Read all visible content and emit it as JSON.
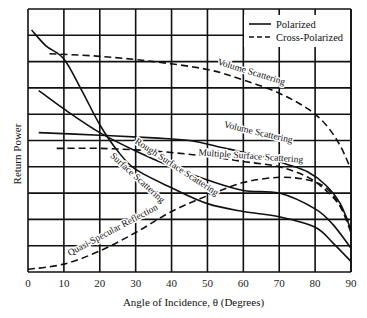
{
  "chart_data": {
    "type": "line",
    "title": "",
    "xlabel": "Angle of Incidence, θ (Degrees)",
    "ylabel": "Return Power",
    "xlim": [
      0,
      90
    ],
    "ylim": [
      0,
      10
    ],
    "x_ticks": [
      "0",
      "10",
      "20",
      "30",
      "40",
      "50",
      "60",
      "70",
      "80",
      "90"
    ],
    "y_ticks": [],
    "grid": true,
    "legend": {
      "position": "top-right",
      "entries": [
        {
          "label": "Polarized",
          "style": "solid"
        },
        {
          "label": "Cross-Polarized",
          "style": "dashed"
        }
      ]
    },
    "series": [
      {
        "name": "Volume Scattering (cross-polarized)",
        "style": "dashed",
        "x": [
          6,
          20,
          35,
          50,
          60,
          70,
          78,
          83,
          87,
          90
        ],
        "y": [
          8.3,
          8.2,
          8.0,
          7.7,
          7.3,
          6.8,
          6.2,
          5.6,
          4.8,
          3.9
        ]
      },
      {
        "name": "Surface Scattering (polarized)",
        "style": "solid",
        "x": [
          1,
          5,
          10,
          15,
          20,
          25,
          30,
          40,
          50,
          60,
          70,
          80,
          85,
          90
        ],
        "y": [
          9.2,
          8.6,
          8.1,
          6.9,
          5.6,
          4.6,
          3.9,
          3.2,
          2.6,
          2.3,
          2.1,
          1.7,
          1.1,
          0.4
        ]
      },
      {
        "name": "Rough Surface Scattering (polarized)",
        "style": "solid",
        "x": [
          3,
          10,
          20,
          30,
          40,
          50,
          60,
          70,
          80,
          85,
          90
        ],
        "y": [
          6.9,
          6.2,
          5.3,
          4.6,
          4.0,
          3.5,
          3.1,
          3.0,
          2.4,
          1.8,
          0.9
        ]
      },
      {
        "name": "Volume Scattering (polarized)",
        "style": "solid",
        "x": [
          3,
          20,
          35,
          45,
          55,
          65,
          72,
          78,
          83,
          87,
          90
        ],
        "y": [
          5.3,
          5.2,
          5.1,
          5.0,
          4.7,
          4.4,
          4.1,
          3.8,
          3.3,
          2.6,
          1.6
        ]
      },
      {
        "name": "Multiple Surface Scattering (cross-polarized)",
        "style": "dashed",
        "x": [
          8,
          20,
          35,
          50,
          60,
          70,
          78,
          83,
          87,
          90
        ],
        "y": [
          4.7,
          4.7,
          4.6,
          4.4,
          4.2,
          4.0,
          3.6,
          3.1,
          2.5,
          1.7
        ]
      },
      {
        "name": "Quasi-Specular Reflection (cross-polarized)",
        "style": "dashed",
        "x": [
          0,
          10,
          20,
          30,
          40,
          50,
          60,
          70,
          78,
          83,
          87,
          90
        ],
        "y": [
          0.1,
          0.3,
          0.8,
          1.5,
          2.3,
          2.9,
          3.4,
          3.6,
          3.5,
          3.2,
          2.5,
          1.5
        ]
      }
    ],
    "annotations": [
      {
        "text": "Volume Scattering",
        "x": 62,
        "y": 7.5,
        "rotation": 17
      },
      {
        "text": "Volume Scattering",
        "x": 64,
        "y": 5.2,
        "rotation": 13
      },
      {
        "text": "Multiple Surface Scattering",
        "x": 62,
        "y": 4.3,
        "rotation": 4
      },
      {
        "text": "Rough Surface Scattering",
        "x": 41,
        "y": 3.9,
        "rotation": 33
      },
      {
        "text": "Surface Scattering",
        "x": 30,
        "y": 3.5,
        "rotation": 42
      },
      {
        "text": "Quasi-Specular Reflection",
        "x": 24,
        "y": 1.5,
        "rotation": -28
      }
    ]
  }
}
